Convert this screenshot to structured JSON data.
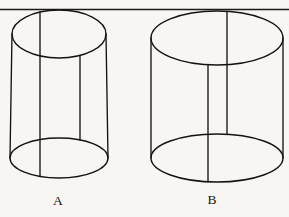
{
  "figure": {
    "background_color": "#f7f6f3",
    "ink_color": "#15130f",
    "width": 289,
    "height": 217,
    "divider": {
      "name": "top-horizontal-rule",
      "y": 9.5,
      "x_start": 0,
      "x_end": 289,
      "color": "#1b1915"
    },
    "objects": [
      {
        "id": "cylinder-a",
        "label": "A",
        "label_x": 58,
        "label_y": 205,
        "description": "tall narrow wireframe cylinder",
        "top_ellipse": {
          "cx": 59,
          "cy": 34,
          "rx": 47,
          "ry": 24
        },
        "bottom_ellipse": {
          "cx": 59,
          "cy": 158,
          "rx": 49,
          "ry": 20
        },
        "silhouette_left_x": 12,
        "silhouette_right_x": 106,
        "interior_lines": [
          {
            "x": 40,
            "from": "top-arc",
            "to": "bottom-arc"
          },
          {
            "x": 80,
            "from": "front-arc",
            "to": "front-arc"
          }
        ]
      },
      {
        "id": "cylinder-b",
        "label": "B",
        "label_x": 212,
        "label_y": 204,
        "description": "wide short wireframe cylinder",
        "top_ellipse": {
          "cx": 217,
          "cy": 38,
          "rx": 66,
          "ry": 27
        },
        "bottom_ellipse": {
          "cx": 217,
          "cy": 158,
          "rx": 66,
          "ry": 24
        },
        "silhouette_left_x": 151,
        "silhouette_right_x": 283,
        "interior_lines": [
          {
            "x": 208,
            "from": "front-arc",
            "to": "bottom-arc"
          },
          {
            "x": 227,
            "from": "top-arc",
            "to": "front-arc"
          }
        ]
      }
    ]
  }
}
